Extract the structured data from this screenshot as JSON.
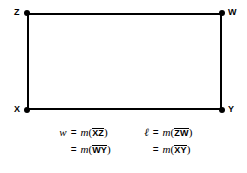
{
  "figure": {
    "shape_name": "rectangle",
    "vertices": [
      {
        "label": "Z",
        "position": "top-left"
      },
      {
        "label": "W",
        "position": "top-right"
      },
      {
        "label": "X",
        "position": "bottom-left"
      },
      {
        "label": "Y",
        "position": "bottom-right"
      }
    ],
    "colors": {
      "stroke": "#000000",
      "background": "#ffffff",
      "text": "#000000"
    }
  },
  "equations": {
    "groups": [
      {
        "name": "width",
        "lines": [
          {
            "lhs": "w",
            "eq": "=",
            "fn": "m",
            "open": "(",
            "segment": "XZ",
            "close": ")"
          },
          {
            "lhs": "",
            "eq": "=",
            "fn": "m",
            "open": "(",
            "segment": "WY",
            "close": ")"
          }
        ]
      },
      {
        "name": "length",
        "lines": [
          {
            "lhs": "ℓ",
            "eq": "=",
            "fn": "m",
            "open": "(",
            "segment": "ZW",
            "close": ")"
          },
          {
            "lhs": "",
            "eq": "=",
            "fn": "m",
            "open": "(",
            "segment": "XY",
            "close": ")"
          }
        ]
      }
    ]
  }
}
